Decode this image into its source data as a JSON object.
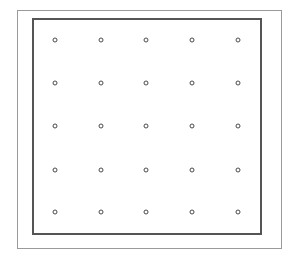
{
  "diagram": {
    "type": "dot-grid",
    "rows": 5,
    "columns": 5,
    "dot_style": "hollow-circle",
    "colors": {
      "background": "#ffffff",
      "outer_frame": "#9a9a9a",
      "inner_frame": "#555555",
      "dot_stroke": "#4a4a4a"
    },
    "column_x": [
      55,
      101,
      146,
      192,
      238
    ],
    "row_y": [
      40,
      83,
      126,
      170,
      212
    ]
  }
}
